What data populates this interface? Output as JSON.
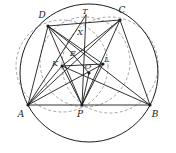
{
  "figure": {
    "width": 176,
    "height": 153,
    "background_color": "#ffffff",
    "stroke_color": "#1c1c1c",
    "dashed_color": "#8a8a8a"
  },
  "labels": {
    "A": "A",
    "B": "B",
    "C": "C",
    "D": "D",
    "E": "E",
    "K": "K",
    "L": "L",
    "O": "O",
    "P": "P",
    "T": "T",
    "X": "X"
  },
  "points": {
    "A": {
      "x": 28,
      "y": 105,
      "label": "A",
      "label_x": 21,
      "label_y": 115
    },
    "B": {
      "x": 150,
      "y": 105,
      "label": "B",
      "label_x": 153,
      "label_y": 115
    },
    "C": {
      "x": 120,
      "y": 20,
      "label": "C",
      "label_x": 120,
      "label_y": 13
    },
    "D": {
      "x": 48,
      "y": 26,
      "label": "D",
      "label_x": 41,
      "label_y": 19
    },
    "E": {
      "x": 74,
      "y": 57,
      "label": "E",
      "label_x": 71,
      "label_y": 55
    },
    "K": {
      "x": 62,
      "y": 66,
      "label": "K",
      "label_x": 55,
      "label_y": 64
    },
    "L": {
      "x": 103,
      "y": 64,
      "label": "L",
      "label_x": 105,
      "label_y": 61
    },
    "O": {
      "x": 89,
      "y": 73,
      "label": "O",
      "label_x": 87,
      "label_y": 69
    },
    "P": {
      "x": 82,
      "y": 105,
      "label": "P",
      "label_x": 79,
      "label_y": 115
    },
    "T": {
      "x": 86,
      "y": 15,
      "label": "T",
      "label_x": 84,
      "label_y": 13
    },
    "X": {
      "x": 81,
      "y": 31,
      "label": "X",
      "label_x": 79,
      "label_y": 33
    }
  },
  "segments": [
    {
      "name": "AB",
      "from": "A",
      "to": "B"
    },
    {
      "name": "AD",
      "from": "A",
      "to": "D"
    },
    {
      "name": "DC",
      "from": "D",
      "to": "C"
    },
    {
      "name": "CB",
      "from": "C",
      "to": "B"
    },
    {
      "name": "AC",
      "from": "A",
      "to": "C"
    },
    {
      "name": "DB",
      "from": "D",
      "to": "B"
    },
    {
      "name": "AP",
      "from": "A",
      "to": "P"
    },
    {
      "name": "PB",
      "from": "P",
      "to": "B"
    },
    {
      "name": "DP",
      "from": "D",
      "to": "P"
    },
    {
      "name": "CP",
      "from": "C",
      "to": "P"
    },
    {
      "name": "AL",
      "from": "A",
      "to": "L"
    },
    {
      "name": "AT",
      "from": "A",
      "to": "T"
    },
    {
      "name": "BK",
      "from": "B",
      "to": "K"
    },
    {
      "name": "AK",
      "from": "A",
      "to": "K"
    },
    {
      "name": "KL",
      "from": "K",
      "to": "L"
    },
    {
      "name": "KP",
      "from": "K",
      "to": "P"
    },
    {
      "name": "LP",
      "from": "L",
      "to": "P"
    },
    {
      "name": "OP",
      "from": "O",
      "to": "P"
    },
    {
      "name": "DO",
      "from": "D",
      "to": "O"
    },
    {
      "name": "TP",
      "from": "T",
      "to": "P"
    },
    {
      "name": "CK",
      "from": "C",
      "to": "K"
    },
    {
      "name": "DL",
      "from": "D",
      "to": "L"
    }
  ],
  "circles": [
    {
      "name": "circumcircle-ABCD",
      "cx": 89,
      "cy": 73,
      "r": 69,
      "style": "solid"
    },
    {
      "name": "dashed-circle-left",
      "cx": 62,
      "cy": 66,
      "r": 46,
      "style": "dashed"
    },
    {
      "name": "dashed-circle-right",
      "cx": 110,
      "cy": 65,
      "r": 48,
      "style": "dashed"
    },
    {
      "name": "dashed-circle-inner",
      "cx": 85,
      "cy": 62,
      "r": 45,
      "style": "dashed"
    }
  ],
  "marked_points": [
    "A",
    "B",
    "C",
    "D",
    "K",
    "L",
    "O",
    "P"
  ]
}
